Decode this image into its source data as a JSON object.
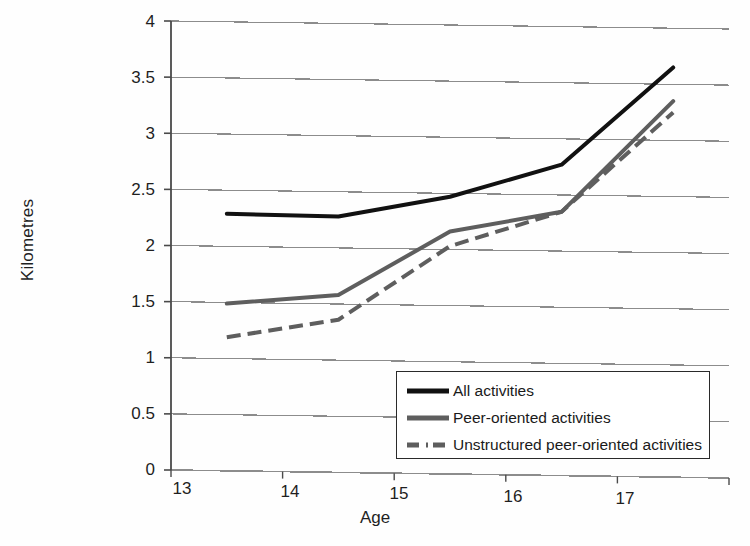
{
  "chart_data": {
    "type": "line",
    "title": "",
    "xlabel": "Age",
    "ylabel": "Kilometres",
    "categories": [
      "13",
      "14",
      "15",
      "16",
      "17"
    ],
    "x": [
      13,
      14,
      15,
      16,
      17
    ],
    "ylim": [
      0,
      4
    ],
    "yticks": [
      "0",
      "0.5",
      "1",
      "1.5",
      "2",
      "2.5",
      "3",
      "3.5",
      "4"
    ],
    "ytick_values": [
      0,
      0.5,
      1,
      1.5,
      2,
      2.5,
      3,
      3.5,
      4
    ],
    "grid": true,
    "legend_position": "inside-bottom-right",
    "series": [
      {
        "name": "All activities",
        "values": [
          2.29,
          2.28,
          2.47,
          2.77,
          3.65
        ],
        "color": "#111111",
        "style": "solid",
        "width": 4
      },
      {
        "name": "Peer-oriented activities",
        "values": [
          1.49,
          1.58,
          2.16,
          2.35,
          3.35
        ],
        "color": "#5e5e5e",
        "style": "solid",
        "width": 4
      },
      {
        "name": "Unstructured peer-oriented activities",
        "values": [
          1.19,
          1.36,
          2.03,
          2.35,
          3.25
        ],
        "color": "#5e5e5e",
        "style": "dashed",
        "width": 4
      }
    ]
  },
  "axis": {
    "y_title": "Kilometres",
    "x_title": "Age",
    "y_tick_labels": [
      "4",
      "3.5",
      "3",
      "2.5",
      "2",
      "1.5",
      "1",
      "0.5",
      "0"
    ],
    "x_tick_labels": [
      "13",
      "14",
      "15",
      "16",
      "17"
    ]
  },
  "legend": {
    "items": [
      {
        "label": "All activities",
        "swatch": "solid-black-line"
      },
      {
        "label": "Peer-oriented activities",
        "swatch": "solid-grey-line"
      },
      {
        "label": "Unstructured peer-oriented activities",
        "swatch": "dashed-grey-line"
      }
    ]
  },
  "colors": {
    "series_all": "#111111",
    "series_peer": "#5e5e5e",
    "series_unstructured": "#5e5e5e",
    "grid": "#8c8c8c",
    "axis": "#4a4a4a",
    "background": "#ffffff"
  }
}
